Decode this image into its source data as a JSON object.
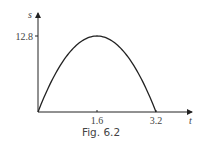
{
  "chart_data": {
    "type": "line",
    "title": "",
    "xlabel": "t",
    "ylabel": "s",
    "xlim": [
      0,
      4.1
    ],
    "ylim": [
      0,
      16
    ],
    "xticks": [
      1.6,
      3.2
    ],
    "xtick_labels": [
      "1.6",
      "3.2"
    ],
    "yticks": [
      12.8
    ],
    "ytick_labels": [
      "12.8"
    ],
    "grid": false,
    "series": [
      {
        "name": "s(t)",
        "function": "s = 16t - 5t^2",
        "x": [
          0,
          0.4,
          0.8,
          1.2,
          1.6,
          2.0,
          2.4,
          2.8,
          3.2
        ],
        "y": [
          0,
          5.6,
          9.6,
          12.0,
          12.8,
          12.0,
          9.6,
          5.6,
          0
        ]
      }
    ]
  },
  "caption": "Fig. 6.2"
}
